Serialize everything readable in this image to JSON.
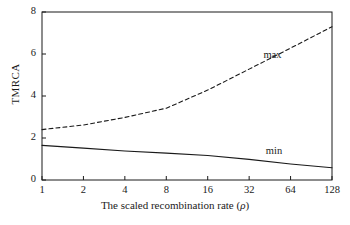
{
  "chart_data": {
    "type": "line",
    "title": "",
    "xlabel": "The scaled recombination rate (ρ)",
    "ylabel": "TMRCA",
    "xscale": "log2",
    "x": [
      1,
      2,
      4,
      8,
      16,
      32,
      64,
      128
    ],
    "xtick_labels": [
      "1",
      "2",
      "4",
      "8",
      "16",
      "32",
      "64",
      "128"
    ],
    "ytick_labels": [
      "0",
      "2",
      "4",
      "6",
      "8"
    ],
    "yticks": [
      0,
      2,
      4,
      6,
      8
    ],
    "ylim": [
      0,
      8
    ],
    "xlim": [
      1,
      128
    ],
    "grid": false,
    "legend": "inline-annotations",
    "series": [
      {
        "name": "max",
        "style": "dashed",
        "color": "#1a1a1a",
        "values": [
          2.4,
          2.62,
          2.98,
          3.42,
          4.28,
          5.28,
          6.28,
          7.3
        ]
      },
      {
        "name": "min",
        "style": "solid",
        "color": "#1a1a1a",
        "values": [
          1.65,
          1.52,
          1.38,
          1.28,
          1.17,
          0.98,
          0.76,
          0.58
        ]
      }
    ],
    "annotations": [
      {
        "text": "max",
        "x": 48,
        "y": 5.9
      },
      {
        "text": "min",
        "x": 50,
        "y": 1.35
      }
    ]
  },
  "axis": {
    "y_label": "TMRCA",
    "x_label_prefix": "The scaled recombination rate (",
    "x_label_rho": "ρ",
    "x_label_suffix": ")"
  },
  "colors": {
    "frame": "#1a1a1a",
    "ink": "#1a1a1a",
    "background": "#ffffff"
  }
}
